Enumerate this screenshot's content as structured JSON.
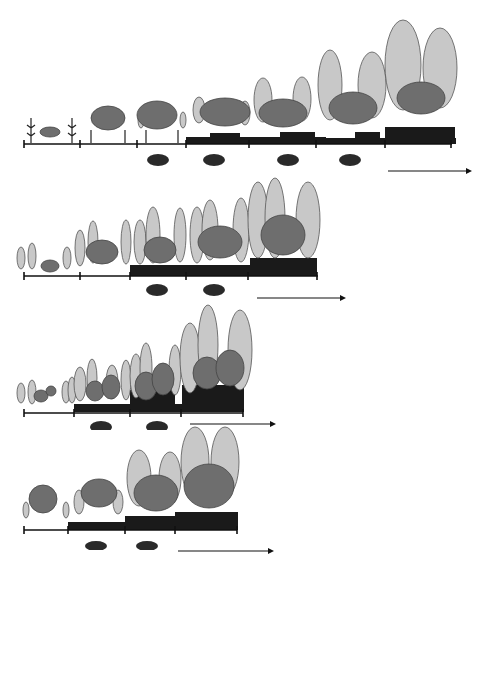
{
  "legend": {
    "title": "Legend",
    "items": [
      {
        "label": "Tobacco",
        "icon": "tobacco-icon"
      },
      {
        "label": "Chilli",
        "icon": "chilli-icon"
      },
      {
        "label": "Cinnamon tree",
        "icon": "cinnamon-tree-icon"
      },
      {
        "label": "Coffee tree",
        "icon": "coffee-tree-icon"
      },
      {
        "label": "Pollarded coffee regrowth",
        "icon": "pollarded-coffee-icon"
      },
      {
        "label": "Pollarded cinnamon regrowth",
        "icon": "pollarded-cinnamon-icon"
      },
      {
        "label": "Secondary regrowth",
        "icon": "secondary-regrowth-icon"
      },
      {
        "label": "Coffee harvest",
        "icon": "coffee-harvest-icon"
      }
    ]
  },
  "panels": [
    {
      "label": "A",
      "ticks": [
        "0",
        "1",
        "2",
        "3",
        "4",
        "5",
        "6",
        "7"
      ],
      "harvest_after_tick": [
        2,
        3,
        4,
        5
      ]
    },
    {
      "label": "B",
      "ticks": [
        "0",
        "1",
        "2",
        "3",
        "4",
        "5"
      ],
      "harvest_after_tick": [
        2,
        3
      ]
    },
    {
      "label": "C",
      "ticks": [
        "0",
        "1",
        "2",
        "3",
        "4"
      ],
      "harvest_after_tick": [
        1,
        2
      ]
    },
    {
      "label": "D",
      "ticks": [
        "0",
        "1",
        "2",
        "3",
        "4"
      ],
      "harvest_after_tick": [
        1,
        2
      ]
    },
    {
      "label": "E",
      "ticks": [
        "0",
        "1",
        "2",
        "3"
      ],
      "harvest_after_tick": [
        1
      ]
    }
  ],
  "colors": {
    "coffee_fill": "#6e6e6e",
    "cinnamon_fill": "#c8c8c8",
    "regrowth_fill": "#1a1a1a",
    "axis": "#111111"
  }
}
